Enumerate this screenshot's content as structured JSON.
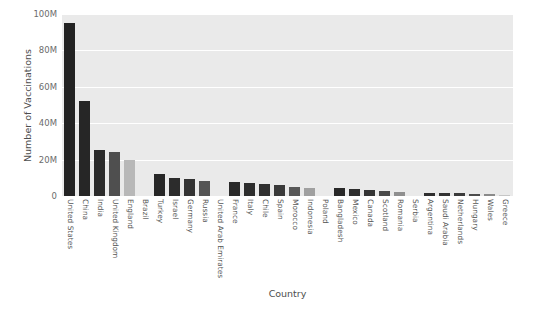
{
  "chart_data": {
    "type": "bar",
    "title": "",
    "xlabel": "Country",
    "ylabel": "Number of Vaccinations",
    "ylim": [
      0,
      100000000
    ],
    "ytick_labels": [
      "0",
      "20M",
      "40M",
      "60M",
      "80M",
      "100M"
    ],
    "ytick_values": [
      0,
      20000000,
      40000000,
      60000000,
      80000000,
      100000000
    ],
    "grid": true,
    "legend": "none",
    "categories": [
      "United States",
      "China",
      "India",
      "United Kingdom",
      "England",
      "Brazil",
      "Turkey",
      "Israel",
      "Germany",
      "Russia",
      "United Arab Emirates",
      "France",
      "Italy",
      "Chile",
      "Spain",
      "Morocco",
      "Indonesia",
      "Poland",
      "Bangladesh",
      "Mexico",
      "Canada",
      "Scotland",
      "Romania",
      "Serbia",
      "Argentina",
      "Saudi Arabia",
      "Netherlands",
      "Hungary",
      "Wales",
      "Greece"
    ],
    "values": [
      95000000,
      52000000,
      25500000,
      24000000,
      20000000,
      0,
      12000000,
      10000000,
      9500000,
      8000000,
      0,
      7800000,
      7000000,
      6500000,
      6000000,
      5000000,
      4500000,
      0,
      4200000,
      4000000,
      3500000,
      2500000,
      2000000,
      0,
      1800000,
      1700000,
      1600000,
      1200000,
      900000,
      700000
    ],
    "bar_colors": [
      "#232323",
      "#262626",
      "#2b2b2b",
      "#4f4f4f",
      "#b8b8b8",
      "#f2f2f2",
      "#272727",
      "#2c2c2c",
      "#333333",
      "#555555",
      "#c9c9c9",
      "#2a2a2a",
      "#2d2d2d",
      "#303030",
      "#3a3a3a",
      "#585858",
      "#a0a0a0",
      "#eeeeee",
      "#282828",
      "#2e2e2e",
      "#343434",
      "#4a4a4a",
      "#8f8f8f",
      "#f4f4f4",
      "#2f2f2f",
      "#333333",
      "#3b3b3b",
      "#4c4c4c",
      "#8a8a8a",
      "#c6c6c6"
    ]
  },
  "style": {
    "plot_background": "#eaeaea",
    "grid_color": "#ffffff",
    "figure_background": "#ffffff",
    "tick_text_color": "#6b6b6b",
    "axis_label_color": "#4d4d4d"
  }
}
